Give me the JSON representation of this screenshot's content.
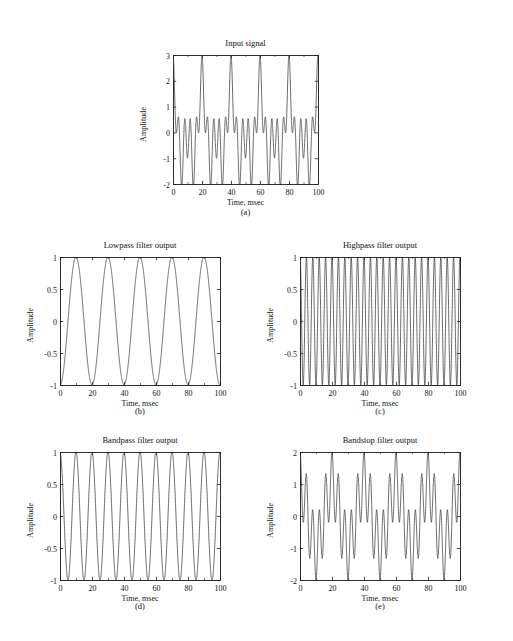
{
  "figure": {
    "background": "#ffffff",
    "line_color": "#3a3a3a",
    "axis_color": "#1a1a1a"
  },
  "panels": [
    {
      "key": "input_signal",
      "title": "Input signal",
      "caption": "(a)",
      "xlabel": "Time, msec",
      "ylabel": "Amplitude"
    },
    {
      "key": "lowpass",
      "title": "Lowpass filter output",
      "caption": "(b)",
      "xlabel": "Time, msec",
      "ylabel": "Amplitude"
    },
    {
      "key": "highpass",
      "title": "Highpass filter output",
      "caption": "(c)",
      "xlabel": "Time, msec",
      "ylabel": "Amplitude"
    },
    {
      "key": "bandpass",
      "title": "Bandpass filter output",
      "caption": "(d)",
      "xlabel": "Time, msec",
      "ylabel": "Amplitude"
    },
    {
      "key": "bandstop",
      "title": "Bandstop filter output",
      "caption": "(e)",
      "xlabel": "Time, msec",
      "ylabel": "Amplitude"
    }
  ],
  "chart_data": [
    {
      "id": "input_signal",
      "type": "line",
      "title": "Input signal",
      "xlabel": "Time, msec",
      "ylabel": "Amplitude",
      "xlim": [
        0,
        100
      ],
      "ylim": [
        -2,
        3
      ],
      "xticks": [
        0,
        20,
        40,
        60,
        80,
        100
      ],
      "xticklabels": [
        "0",
        "20",
        "40",
        "60",
        "80",
        "100"
      ],
      "yticks": [
        -2,
        -1,
        0,
        1,
        2,
        3
      ],
      "yticklabels": [
        "-2",
        "-1",
        "0",
        "1",
        "2",
        "3"
      ],
      "grid": false,
      "legend": "none",
      "series": [
        {
          "name": "input",
          "components": [
            {
              "amplitude": 1,
              "freq_hz": 50,
              "phase_deg": 90
            },
            {
              "amplitude": 1,
              "freq_hz": 100,
              "phase_deg": 90
            },
            {
              "amplitude": 1,
              "freq_hz": 250,
              "phase_deg": 90
            }
          ]
        }
      ]
    },
    {
      "id": "lowpass",
      "type": "line",
      "title": "Lowpass filter output",
      "xlabel": "Time, msec",
      "ylabel": "Amplitude",
      "xlim": [
        0,
        100
      ],
      "ylim": [
        -1,
        1
      ],
      "xticks": [
        0,
        20,
        40,
        60,
        80,
        100
      ],
      "xticklabels": [
        "0",
        "20",
        "40",
        "60",
        "80",
        "100"
      ],
      "yticks": [
        -1,
        -0.5,
        0,
        0.5,
        1
      ],
      "yticklabels": [
        "-1",
        "-0.5",
        "0",
        "0.5",
        "1"
      ],
      "grid": false,
      "legend": "none",
      "series": [
        {
          "name": "lowpass",
          "components": [
            {
              "amplitude": 1,
              "freq_hz": 50,
              "phase_deg": 270
            }
          ]
        }
      ]
    },
    {
      "id": "highpass",
      "type": "line",
      "title": "Highpass filter output",
      "xlabel": "Time, msec",
      "ylabel": "Amplitude",
      "xlim": [
        0,
        100
      ],
      "ylim": [
        -1,
        1
      ],
      "xticks": [
        0,
        20,
        40,
        60,
        80,
        100
      ],
      "xticklabels": [
        "0",
        "20",
        "40",
        "60",
        "80",
        "100"
      ],
      "yticks": [
        -1,
        -0.5,
        0,
        0.5,
        1
      ],
      "yticklabels": [
        "-1",
        "-0.5",
        "0",
        "0.5",
        "1"
      ],
      "grid": false,
      "legend": "none",
      "series": [
        {
          "name": "highpass",
          "components": [
            {
              "amplitude": 1,
              "freq_hz": 250,
              "phase_deg": 90
            }
          ]
        }
      ]
    },
    {
      "id": "bandpass",
      "type": "line",
      "title": "Bandpass filter output",
      "xlabel": "Time, msec",
      "ylabel": "Amplitude",
      "xlim": [
        0,
        100
      ],
      "ylim": [
        -1,
        1
      ],
      "xticks": [
        0,
        20,
        40,
        60,
        80,
        100
      ],
      "xticklabels": [
        "0",
        "20",
        "40",
        "60",
        "80",
        "100"
      ],
      "yticks": [
        -1,
        -0.5,
        0,
        0.5,
        1
      ],
      "yticklabels": [
        "-1",
        "-0.5",
        "0",
        "0.5",
        "1"
      ],
      "grid": false,
      "legend": "none",
      "series": [
        {
          "name": "bandpass",
          "components": [
            {
              "amplitude": 1,
              "freq_hz": 100,
              "phase_deg": 90
            }
          ]
        }
      ]
    },
    {
      "id": "bandstop",
      "type": "line",
      "title": "Bandstop filter output",
      "xlabel": "Time, msec",
      "ylabel": "Amplitude",
      "xlim": [
        0,
        100
      ],
      "ylim": [
        -2,
        2
      ],
      "xticks": [
        0,
        20,
        40,
        60,
        80,
        100
      ],
      "xticklabels": [
        "0",
        "20",
        "40",
        "60",
        "80",
        "100"
      ],
      "yticks": [
        -2,
        -1,
        0,
        1,
        2
      ],
      "yticklabels": [
        "-2",
        "-1",
        "0",
        "1",
        "2"
      ],
      "grid": false,
      "legend": "none",
      "series": [
        {
          "name": "bandstop",
          "components": [
            {
              "amplitude": 1,
              "freq_hz": 50,
              "phase_deg": 90
            },
            {
              "amplitude": 1,
              "freq_hz": 250,
              "phase_deg": 90
            }
          ]
        }
      ]
    }
  ],
  "layout": {
    "panel_a": {
      "left": 173,
      "top": 55,
      "width": 145,
      "height": 129,
      "title_top": 38,
      "caption_top": 207,
      "caption_left": 173,
      "caption_width": 145
    },
    "panel_b": {
      "left": 60,
      "top": 257,
      "width": 160,
      "height": 128,
      "title_top": 240,
      "caption_top": 406,
      "caption_left": 60,
      "caption_width": 160
    },
    "panel_c": {
      "left": 300,
      "top": 257,
      "width": 160,
      "height": 128,
      "title_top": 240,
      "caption_top": 406,
      "caption_left": 300,
      "caption_width": 160
    },
    "panel_d": {
      "left": 60,
      "top": 452,
      "width": 160,
      "height": 128,
      "title_top": 435,
      "caption_top": 601,
      "caption_left": 60,
      "caption_width": 160
    },
    "panel_e": {
      "left": 300,
      "top": 452,
      "width": 160,
      "height": 128,
      "title_top": 435,
      "caption_top": 601,
      "caption_left": 300,
      "caption_width": 160
    }
  }
}
